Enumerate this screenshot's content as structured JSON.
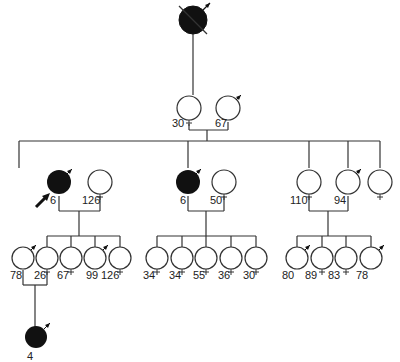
{
  "diagram": {
    "type": "pedigree",
    "generation_0": {
      "proband_ancestor": {
        "sex": "male",
        "affected": true,
        "deceased": true,
        "label": ""
      }
    },
    "generation_1": {
      "individuals": [
        {
          "sex": "female",
          "affected": false,
          "label": "30"
        },
        {
          "sex": "male",
          "affected": false,
          "label": "67"
        }
      ]
    },
    "generation_2": {
      "individuals": [
        {
          "sex": "male",
          "affected": true,
          "label": "6",
          "proband": true
        },
        {
          "sex": "female",
          "affected": false,
          "label": "126"
        },
        {
          "sex": "male",
          "affected": true,
          "label": "6"
        },
        {
          "sex": "female",
          "affected": false,
          "label": "50"
        },
        {
          "sex": "female",
          "affected": false,
          "label": "110"
        },
        {
          "sex": "male",
          "affected": false,
          "label": "94"
        },
        {
          "sex": "female",
          "affected": false,
          "label": ""
        }
      ]
    },
    "generation_3": {
      "family_a": [
        {
          "sex": "male",
          "label": "78"
        },
        {
          "sex": "female",
          "label": "26"
        },
        {
          "sex": "female",
          "label": "67"
        },
        {
          "sex": "male",
          "label": "99"
        },
        {
          "sex": "female",
          "label": "126"
        }
      ],
      "family_b": [
        {
          "sex": "female",
          "label": "34"
        },
        {
          "sex": "female",
          "label": "34"
        },
        {
          "sex": "female",
          "label": "55"
        },
        {
          "sex": "female",
          "label": "36"
        },
        {
          "sex": "female",
          "label": "30"
        }
      ],
      "family_c": [
        {
          "sex": "male",
          "label": "80"
        },
        {
          "sex": "female",
          "label": "89"
        },
        {
          "sex": "female",
          "label": "83"
        },
        {
          "sex": "male",
          "label": "78"
        }
      ]
    },
    "generation_4": {
      "individuals": [
        {
          "sex": "male",
          "affected": true,
          "label": "4"
        }
      ]
    },
    "colors": {
      "line": "#333333",
      "affected_fill": "#111111",
      "unaffected_fill": "#ffffff"
    }
  }
}
